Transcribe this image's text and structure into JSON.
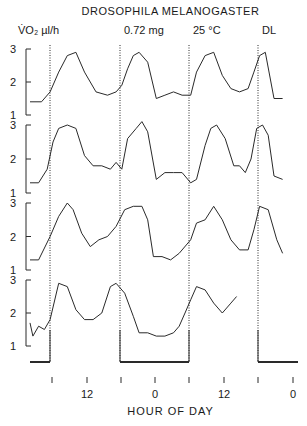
{
  "header": {
    "title": "DROSOPHILA  MELANOGASTER",
    "ylabel": "V̇O₂ µl/h",
    "mass": "0.72 mg",
    "temperature": "25 °C",
    "condition": "DL"
  },
  "xaxis": {
    "label": "HOUR  OF  DAY",
    "tick_labels": [
      {
        "text": "12",
        "x": 87
      },
      {
        "text": "0",
        "x": 155
      },
      {
        "text": "12",
        "x": 224
      },
      {
        "text": "0",
        "x": 293
      }
    ],
    "tick_x": [
      52,
      87,
      121,
      155,
      189,
      224,
      258,
      293
    ]
  },
  "colors": {
    "line": "#2a2a2a",
    "axis": "#2a2a2a",
    "bg": "#ffffff"
  },
  "chart_data": {
    "type": "line",
    "title": "DROSOPHILA MELANOGASTER",
    "subtitle": "0.72 mg, 25 °C, DL",
    "xlabel": "HOUR OF DAY",
    "ylabel": "VO2 µl/h",
    "ylim": [
      1,
      3
    ],
    "yticks": [
      1,
      2,
      3
    ],
    "x_tick_labels": [
      "12",
      "0",
      "12",
      "0"
    ],
    "x_unit": "hours elapsed from left edge (each panel row = consecutive days, double-plot style)",
    "light_dark_markers_x_hours": [
      18,
      38,
      58,
      78
    ],
    "dark_bars": [
      [
        0,
        18
      ],
      [
        38,
        58
      ],
      [
        78,
        88
      ]
    ],
    "series": [
      {
        "name": "Record 1",
        "points": [
          [
            0,
            1.4
          ],
          [
            4,
            1.4
          ],
          [
            7,
            1.7
          ],
          [
            10,
            2.3
          ],
          [
            13,
            2.8
          ],
          [
            16,
            2.9
          ],
          [
            19,
            2.3
          ],
          [
            23,
            1.7
          ],
          [
            27,
            1.6
          ],
          [
            30,
            1.7
          ],
          [
            32,
            1.9
          ],
          [
            34,
            2.4
          ],
          [
            36,
            2.8
          ],
          [
            38,
            2.9
          ],
          [
            41,
            2.6
          ],
          [
            44,
            1.5
          ],
          [
            47,
            1.6
          ],
          [
            50,
            1.7
          ],
          [
            53,
            1.6
          ],
          [
            56,
            1.6
          ],
          [
            58,
            2.3
          ],
          [
            61,
            2.8
          ],
          [
            64,
            2.9
          ],
          [
            67,
            2.2
          ],
          [
            70,
            1.8
          ],
          [
            73,
            1.7
          ],
          [
            76,
            1.8
          ],
          [
            78,
            2.3
          ],
          [
            80,
            2.8
          ],
          [
            82,
            2.9
          ],
          [
            85,
            1.5
          ],
          [
            88,
            1.5
          ]
        ]
      },
      {
        "name": "Record 2",
        "points": [
          [
            0,
            1.3
          ],
          [
            3,
            1.3
          ],
          [
            6,
            1.7
          ],
          [
            8,
            2.5
          ],
          [
            10,
            2.9
          ],
          [
            13,
            3.0
          ],
          [
            16,
            2.9
          ],
          [
            19,
            2.1
          ],
          [
            22,
            1.8
          ],
          [
            25,
            1.8
          ],
          [
            28,
            1.7
          ],
          [
            30,
            1.9
          ],
          [
            32,
            1.7
          ],
          [
            34,
            2.6
          ],
          [
            37,
            2.9
          ],
          [
            39,
            3.1
          ],
          [
            41,
            2.8
          ],
          [
            44,
            1.4
          ],
          [
            47,
            1.6
          ],
          [
            50,
            1.6
          ],
          [
            53,
            1.6
          ],
          [
            56,
            1.3
          ],
          [
            58,
            1.4
          ],
          [
            61,
            2.4
          ],
          [
            63,
            2.9
          ],
          [
            65,
            3.0
          ],
          [
            68,
            2.6
          ],
          [
            71,
            1.8
          ],
          [
            73,
            1.8
          ],
          [
            75,
            1.6
          ],
          [
            77,
            2.0
          ],
          [
            79,
            2.9
          ],
          [
            81,
            3.0
          ],
          [
            83,
            2.7
          ],
          [
            85,
            1.5
          ],
          [
            88,
            1.4
          ]
        ]
      },
      {
        "name": "Record 3",
        "points": [
          [
            0,
            1.3
          ],
          [
            3,
            1.3
          ],
          [
            7,
            2.0
          ],
          [
            10,
            2.6
          ],
          [
            13,
            3.0
          ],
          [
            15,
            2.8
          ],
          [
            18,
            2.1
          ],
          [
            21,
            1.7
          ],
          [
            24,
            1.9
          ],
          [
            27,
            2.0
          ],
          [
            30,
            2.3
          ],
          [
            33,
            2.8
          ],
          [
            36,
            2.9
          ],
          [
            39,
            2.9
          ],
          [
            41,
            2.5
          ],
          [
            43,
            1.4
          ],
          [
            46,
            1.4
          ],
          [
            49,
            1.3
          ],
          [
            52,
            1.5
          ],
          [
            56,
            1.9
          ],
          [
            58,
            2.4
          ],
          [
            61,
            2.5
          ],
          [
            64,
            2.9
          ],
          [
            67,
            2.5
          ],
          [
            70,
            1.9
          ],
          [
            73,
            1.6
          ],
          [
            76,
            1.6
          ],
          [
            78,
            2.2
          ],
          [
            80,
            2.9
          ],
          [
            83,
            2.8
          ],
          [
            86,
            1.9
          ],
          [
            88,
            1.5
          ]
        ]
      },
      {
        "name": "Record 4",
        "points": [
          [
            0,
            1.7
          ],
          [
            1,
            1.3
          ],
          [
            3,
            1.6
          ],
          [
            5,
            1.5
          ],
          [
            7,
            1.8
          ],
          [
            10,
            2.9
          ],
          [
            13,
            2.8
          ],
          [
            16,
            2.1
          ],
          [
            19,
            1.8
          ],
          [
            22,
            1.8
          ],
          [
            25,
            2.0
          ],
          [
            28,
            2.8
          ],
          [
            30,
            2.9
          ],
          [
            33,
            2.6
          ],
          [
            36,
            1.9
          ],
          [
            38,
            1.4
          ],
          [
            41,
            1.4
          ],
          [
            44,
            1.3
          ],
          [
            47,
            1.3
          ],
          [
            50,
            1.4
          ],
          [
            52,
            1.6
          ],
          [
            54,
            2.0
          ],
          [
            56,
            2.4
          ],
          [
            58,
            2.8
          ],
          [
            61,
            2.7
          ],
          [
            64,
            2.3
          ],
          [
            67,
            2.0
          ],
          [
            70,
            2.3
          ],
          [
            72,
            2.5
          ]
        ]
      }
    ]
  },
  "layout": {
    "x_px_per_hour": 2.87,
    "x_origin_px": 30,
    "panels": [
      {
        "y3": 49,
        "y1": 115
      },
      {
        "y3": 125,
        "y1": 193
      },
      {
        "y3": 203,
        "y1": 270
      },
      {
        "y3": 280,
        "y1": 346
      }
    ],
    "dotted_x": [
      50,
      120,
      189,
      258
    ]
  }
}
